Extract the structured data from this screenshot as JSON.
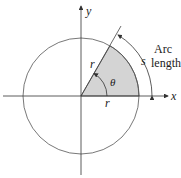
{
  "diagram": {
    "type": "circle-sector-arc-length",
    "axes": {
      "x_label": "x",
      "y_label": "y"
    },
    "labels": {
      "radius_slanted": "r",
      "radius_horizontal": "r",
      "angle": "θ",
      "arc": "s",
      "arc_title_line1": "Arc",
      "arc_title_line2": "length"
    },
    "colors": {
      "sector_fill": "#d4d4d4",
      "stroke": "#333333"
    },
    "geometry": {
      "center": [
        81,
        96
      ],
      "radius": 58,
      "angle_deg": 60
    }
  }
}
